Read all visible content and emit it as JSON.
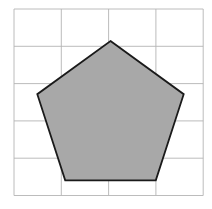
{
  "figure": {
    "background_color": "#ffffff",
    "width": 212,
    "height": 209
  },
  "grid": {
    "name": "square-grid",
    "line_color": "#b4b4b4",
    "line_width": 0.9,
    "x_start": 14,
    "y_start": 9,
    "cell_width": 47.3,
    "cell_height": 37.3,
    "columns": 4,
    "rows": 5,
    "x_lines": [
      14,
      61.3,
      108.6,
      155.9,
      203.2
    ],
    "y_lines": [
      9,
      46.3,
      83.6,
      120.9,
      158.2,
      195.5
    ]
  },
  "shape": {
    "name": "pentagon",
    "type": "regular-pentagon",
    "sides": 5,
    "fill_color": "#a8a8a8",
    "stroke_color": "#1a1a1a",
    "stroke_width": 1.8,
    "center_x": 110.5,
    "center_y": 118,
    "circumradius": 77,
    "vertices": [
      {
        "label": "apex",
        "x": 110.5,
        "y": 41
      },
      {
        "label": "right",
        "x": 183.7,
        "y": 94.2
      },
      {
        "label": "bottom-right",
        "x": 155.8,
        "y": 180.3
      },
      {
        "label": "bottom-left",
        "x": 65.2,
        "y": 180.3
      },
      {
        "label": "left",
        "x": 37.3,
        "y": 94.2
      }
    ],
    "points_attr": "110.5,41 183.7,94.2 155.8,180.3 65.2,180.3 37.3,94.2"
  }
}
